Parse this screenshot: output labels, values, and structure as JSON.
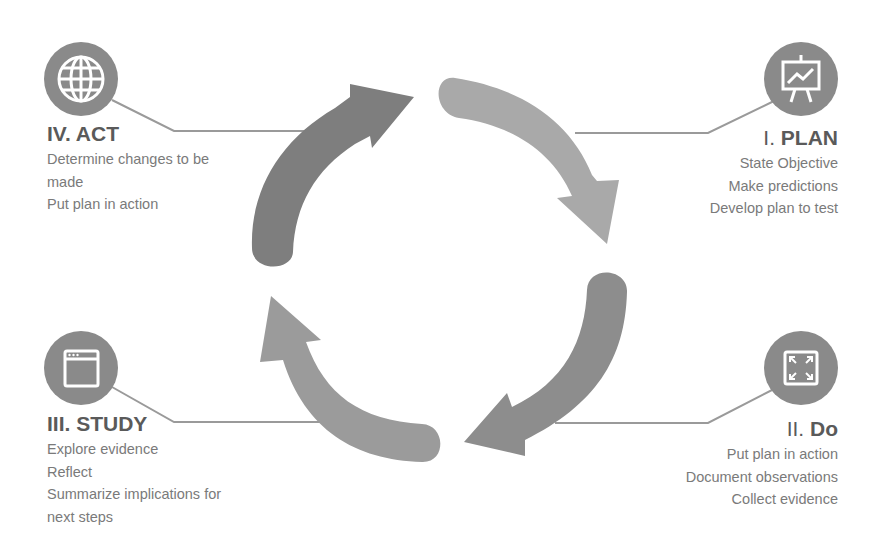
{
  "diagram": {
    "type": "cycle",
    "colors": {
      "arrow_act": "#7e7e7e",
      "arrow_plan": "#a9a9a9",
      "arrow_do": "#8d8d8d",
      "arrow_study": "#9b9b9b",
      "icon_circle": "#8a8a8a",
      "connector": "#999999",
      "heading": "#555555",
      "body_text": "#777777"
    }
  },
  "stages": {
    "plan": {
      "numeral": "I.",
      "name": "PLAN",
      "icon": "presentation-chart-icon",
      "items": [
        "State Objective",
        "Make predictions",
        "Develop plan to test"
      ]
    },
    "do": {
      "numeral": "II.",
      "name": "Do",
      "icon": "expand-arrows-icon",
      "items": [
        "Put plan in action",
        "Document observations",
        "Collect evidence"
      ]
    },
    "study": {
      "numeral": "III.",
      "name": "STUDY",
      "icon": "browser-window-icon",
      "items": [
        "Explore evidence",
        "Reflect",
        "Summarize implications for",
        "next steps"
      ]
    },
    "act": {
      "numeral": "IV.",
      "name": "ACT",
      "icon": "globe-icon",
      "items": [
        "Determine changes to be",
        "made",
        "Put plan in action"
      ]
    }
  }
}
